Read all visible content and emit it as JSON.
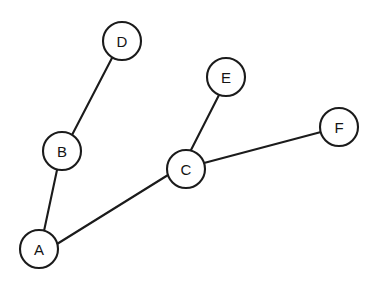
{
  "diagram": {
    "type": "node-link-graph",
    "background_color": "#ffffff",
    "stroke_color": "#1b1b1b",
    "node_fill_color": "#ffffff",
    "label_color": "#141414",
    "stroke_width": 2.1,
    "node_radius": 19,
    "canvas": {
      "width": 381,
      "height": 287
    },
    "nodes": [
      {
        "id": "A",
        "label": "A",
        "cx": 39,
        "cy": 249,
        "r": 19
      },
      {
        "id": "B",
        "label": "B",
        "cx": 62,
        "cy": 151,
        "r": 19
      },
      {
        "id": "C",
        "label": "C",
        "cx": 186,
        "cy": 169,
        "r": 19
      },
      {
        "id": "D",
        "label": "D",
        "cx": 122,
        "cy": 41,
        "r": 19
      },
      {
        "id": "E",
        "label": "E",
        "cx": 226,
        "cy": 77,
        "r": 19
      },
      {
        "id": "F",
        "label": "F",
        "cx": 339,
        "cy": 127,
        "r": 19
      }
    ],
    "edges": [
      {
        "id": "A-B",
        "from": "A",
        "to": "B",
        "x1": 44,
        "y1": 231,
        "x2": 57,
        "y2": 170
      },
      {
        "id": "A-C",
        "from": "A",
        "to": "C",
        "x1": 57,
        "y1": 244,
        "x2": 168,
        "y2": 175
      },
      {
        "id": "B-D",
        "from": "B",
        "to": "D",
        "x1": 72,
        "y1": 135,
        "x2": 112,
        "y2": 58
      },
      {
        "id": "C-E",
        "from": "C",
        "to": "E",
        "x1": 191,
        "y1": 150,
        "x2": 219,
        "y2": 95
      },
      {
        "id": "C-F",
        "from": "C",
        "to": "F",
        "x1": 204,
        "y1": 163,
        "x2": 321,
        "y2": 132
      }
    ]
  }
}
